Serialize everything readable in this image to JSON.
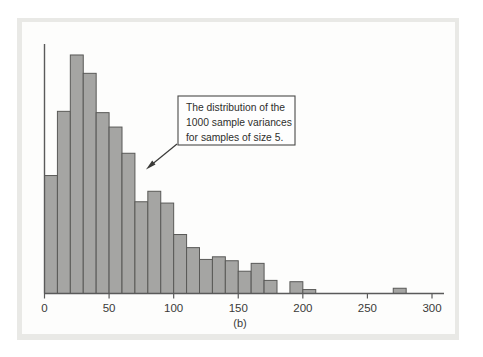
{
  "figure": {
    "panel_caption": "(b)",
    "background_color": "#e9e9e6",
    "panel_color": "#fdfdfc",
    "bar_fill_color": "#a5a5a3",
    "bar_stroke_color": "#595957",
    "axis_color": "#5a5a5a"
  },
  "annotation": {
    "line1": "The distribution of the",
    "line2": "1000 sample variances",
    "line3": "for samples of size 5.",
    "box_border_color": "#4a4a48",
    "arrow_color": "#3a3a38"
  },
  "axis": {
    "x_tick_labels": [
      "0",
      "50",
      "100",
      "150",
      "200",
      "250",
      "300"
    ],
    "x_tick_values": [
      0,
      50,
      100,
      150,
      200,
      250,
      300
    ]
  },
  "chart_data": {
    "type": "bar",
    "title": "",
    "subtitle": "",
    "xlabel": "",
    "ylabel": "",
    "xlim": [
      0,
      310
    ],
    "ylim": [
      0,
      190
    ],
    "grid": false,
    "legend": "none",
    "bin_width": 10,
    "annotations": [
      "The distribution of the 1000 sample variances for samples of size 5."
    ],
    "categories": [
      "0-10",
      "10-20",
      "20-30",
      "30-40",
      "40-50",
      "50-60",
      "60-70",
      "70-80",
      "80-90",
      "90-100",
      "100-110",
      "110-120",
      "120-130",
      "130-140",
      "140-150",
      "150-160",
      "160-170",
      "170-180",
      "180-190",
      "190-200",
      "200-210",
      "210-220",
      "270-280"
    ],
    "bin_starts": [
      0,
      10,
      20,
      30,
      40,
      50,
      60,
      70,
      80,
      90,
      100,
      110,
      120,
      130,
      140,
      150,
      160,
      170,
      180,
      190,
      200,
      210,
      270
    ],
    "values": [
      90,
      139,
      182,
      168,
      138,
      127,
      107,
      70,
      78,
      69,
      45,
      35,
      26,
      28,
      25,
      17,
      23,
      10,
      0,
      9,
      3,
      0,
      4
    ],
    "x": [
      5,
      15,
      25,
      35,
      45,
      55,
      65,
      75,
      85,
      95,
      105,
      115,
      125,
      135,
      145,
      155,
      165,
      175,
      185,
      195,
      205,
      215,
      275
    ]
  }
}
